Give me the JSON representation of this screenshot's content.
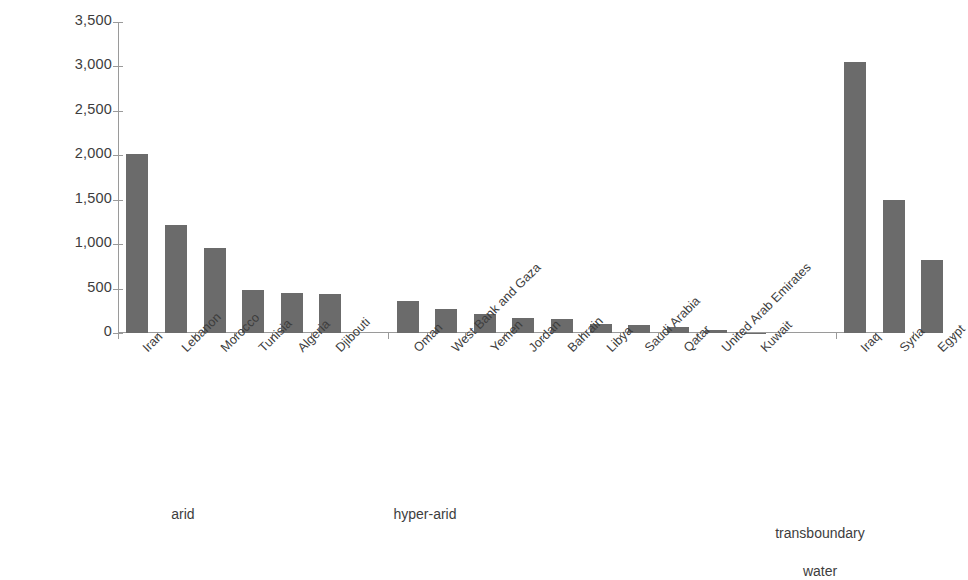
{
  "chart_data": {
    "type": "bar",
    "title": "",
    "subtitle": "",
    "xlabel": "",
    "ylabel": "m³ per inhabitant per year",
    "ylabel_base": "m",
    "ylabel_sup": "3",
    "ylabel_rest": " per inhabitant per year",
    "ylim": [
      0,
      3500
    ],
    "ytick_step": 500,
    "ytick_labels": [
      "3,500",
      "3,000",
      "2,500",
      "2,000",
      "1,500",
      "1,000",
      "500",
      "0"
    ],
    "ytick_values": [
      3500,
      3000,
      2500,
      2000,
      1500,
      1000,
      500,
      0
    ],
    "grid": false,
    "legend": "none",
    "bar_color": "#6b6b6b",
    "axis_color": "#9a9a9a",
    "text_color": "#3d3d3d",
    "background": "#ffffff",
    "categories": [
      "Iran",
      "Lebanon",
      "Morocco",
      "Tunisia",
      "Algeria",
      "Djibouti",
      "Oman",
      "West Bank and Gaza",
      "Yemen",
      "Jordan",
      "Bahrain",
      "Libya",
      "Saudi Arabia",
      "Qatar",
      "United Arab Emirates",
      "Kuwait",
      "Iraq",
      "Syria",
      "Egypt"
    ],
    "values": [
      2010,
      1220,
      960,
      480,
      450,
      435,
      355,
      270,
      210,
      165,
      160,
      100,
      90,
      70,
      35,
      5,
      3050,
      1495,
      820
    ],
    "groups": [
      {
        "label": "arid",
        "categories": [
          "Iran",
          "Lebanon",
          "Morocco",
          "Tunisia",
          "Algeria",
          "Djibouti"
        ]
      },
      {
        "label": "hyper-arid",
        "categories": [
          "Oman",
          "West Bank and Gaza",
          "Yemen",
          "Jordan",
          "Bahrain",
          "Libya",
          "Saudi Arabia",
          "Qatar",
          "United Arab Emirates",
          "Kuwait"
        ]
      },
      {
        "label": "transboundary\nwater",
        "categories": [
          "Iraq",
          "Syria",
          "Egypt"
        ]
      }
    ]
  },
  "group_labels": {
    "arid": "arid",
    "hyper_arid": "hyper-arid",
    "transboundary_line1": "transboundary",
    "transboundary_line2": "water"
  }
}
